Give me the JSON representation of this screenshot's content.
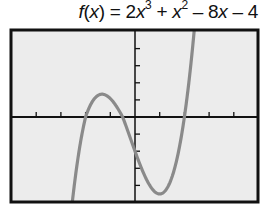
{
  "chart_data": {
    "type": "line",
    "title_parts": {
      "fname": "f",
      "lparen": "(",
      "var": "x",
      "rparen_eq": ") = 2",
      "x1": "x",
      "exp1": "3",
      "plus": " + ",
      "x2": "x",
      "exp2": "2",
      "minus8": " – 8",
      "x3": "x",
      "minus4": " – 4"
    },
    "function": {
      "coefficients": [
        2,
        1,
        -8,
        -4
      ],
      "form": "2x^3 + x^2 - 8x - 4"
    },
    "xlabel": "",
    "ylabel": "",
    "xlim": [
      -5.1,
      5.0
    ],
    "ylim": [
      -10.1,
      10.2
    ],
    "x_ticks": [
      -4,
      -3,
      -2,
      -1,
      1,
      2,
      3,
      4
    ],
    "y_ticks": [
      -8,
      -6,
      -4,
      -2,
      2,
      4,
      6,
      8
    ],
    "tick_labels_shown": false,
    "grid": false,
    "series": [
      {
        "name": "f(x)",
        "x": [
          -2.6,
          -2.4,
          -2.2,
          -2.0,
          -1.8,
          -1.6,
          -1.4,
          -1.2,
          -1.0,
          -0.8,
          -0.6,
          -0.4,
          -0.2,
          0.0,
          0.2,
          0.4,
          0.6,
          0.8,
          1.0,
          1.2,
          1.4,
          1.6,
          1.8,
          2.0,
          2.2,
          2.4,
          2.6
        ],
        "y": [
          -9.39,
          -4.09,
          -0.06,
          2.0,
          2.58,
          2.17,
          1.23,
          0.38,
          1.0,
          -0.26,
          -0.27,
          0.67,
          1.69,
          -4.0,
          -5.58,
          -6.97,
          -7.81,
          -7.74,
          -9.0,
          -8.26,
          -6.75,
          -4.24,
          -0.56,
          4.0,
          10.54,
          18.62,
          28.43
        ],
        "color": "#8a8a8a"
      }
    ],
    "colors": {
      "background": "#ececec",
      "axis": "#111111",
      "curve": "#8a8a8a",
      "frame": "#111111"
    }
  }
}
